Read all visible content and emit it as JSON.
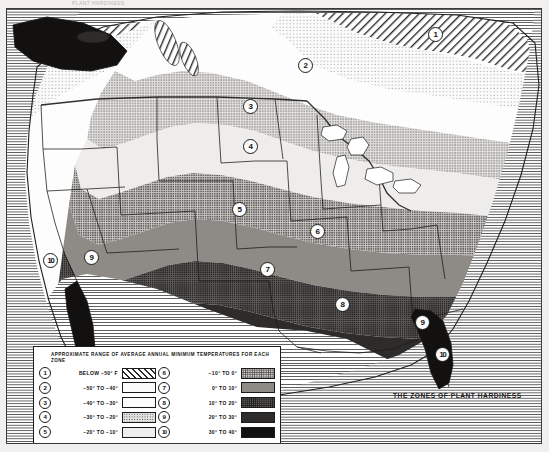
{
  "top_caption": "PLANT HARDINESS",
  "map": {
    "title": "THE ZONES OF PLANT HARDINESS",
    "zone_badges": [
      {
        "label": "1",
        "x": 421,
        "y": 18
      },
      {
        "label": "2",
        "x": 291,
        "y": 49
      },
      {
        "label": "3",
        "x": 236,
        "y": 90
      },
      {
        "label": "4",
        "x": 236,
        "y": 130
      },
      {
        "label": "5",
        "x": 225,
        "y": 193
      },
      {
        "label": "6",
        "x": 303,
        "y": 215
      },
      {
        "label": "7",
        "x": 253,
        "y": 253
      },
      {
        "label": "8",
        "x": 328,
        "y": 288
      },
      {
        "label": "9",
        "x": 408,
        "y": 306
      },
      {
        "label": "10",
        "x": 428,
        "y": 338
      },
      {
        "label": "9",
        "x": 77,
        "y": 241
      },
      {
        "label": "10",
        "x": 36,
        "y": 244
      }
    ]
  },
  "legend": {
    "title": "APPROXIMATE RANGE OF AVERAGE ANNUAL MINIMUM TEMPERATURES FOR EACH ZONE",
    "left_column": [
      {
        "number": "1",
        "range": "BELOW  −50° F",
        "pattern": "diagonal-hatch"
      },
      {
        "number": "2",
        "range": "−50° TO −40°",
        "pattern": "fine-dots"
      },
      {
        "number": "3",
        "range": "−40° TO −30°",
        "pattern": "white"
      },
      {
        "number": "4",
        "range": "−30° TO −20°",
        "pattern": "medium-dots"
      },
      {
        "number": "5",
        "range": "−20° TO −10°",
        "pattern": "light-gray"
      }
    ],
    "right_column": [
      {
        "number": "6",
        "range": "−10° TO      0°",
        "pattern": "coarse-gray-checker"
      },
      {
        "number": "7",
        "range": "0° TO    10°",
        "pattern": "dark-gray"
      },
      {
        "number": "8",
        "range": "10° TO    20°",
        "pattern": "dark-checker"
      },
      {
        "number": "9",
        "range": "20° TO    30°",
        "pattern": "very-dark"
      },
      {
        "number": "10",
        "range": "30° TO    40°",
        "pattern": "black"
      }
    ]
  },
  "colors": {
    "frame_border": "#3a3a3a",
    "legend_border": "#1d1d1d",
    "ink": "#1a1a1a",
    "paper": "#ffffff"
  }
}
